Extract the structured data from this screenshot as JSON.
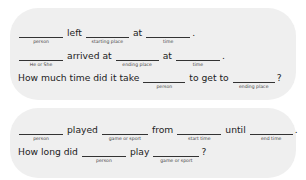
{
  "panel1": {
    "row1": {
      "blanks": [
        {
          "label": "person"
        },
        {
          "label": "starting place"
        },
        {
          "label": "time"
        }
      ],
      "words": [
        "left",
        "at",
        "."
      ]
    },
    "row2": {
      "blanks": [
        {
          "label": "He or She"
        },
        {
          "label": "ending place"
        },
        {
          "label": "time"
        }
      ],
      "words": [
        "arrived at",
        "at",
        "."
      ]
    },
    "row3": {
      "blanks": [
        {
          "label": "person"
        },
        {
          "label": "ending place"
        }
      ],
      "words": [
        "How much time did it take",
        "to get to",
        "?"
      ]
    }
  },
  "panel2": {
    "row1": {
      "blanks": [
        {
          "label": "person"
        },
        {
          "label": "game or sport"
        },
        {
          "label": "start time"
        },
        {
          "label": "end time"
        }
      ],
      "words": [
        "played",
        "from",
        "until",
        "."
      ]
    },
    "row2": {
      "blanks": [
        {
          "label": "person"
        },
        {
          "label": "game or sport"
        }
      ],
      "words": [
        "How long did",
        "play",
        "?"
      ]
    }
  }
}
